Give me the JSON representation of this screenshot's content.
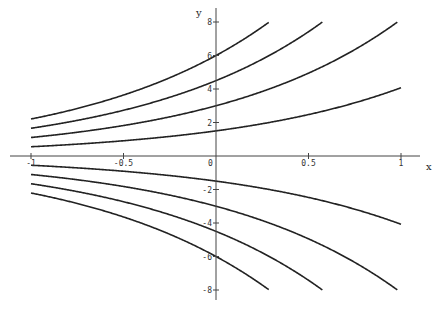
{
  "chart_data": {
    "type": "line",
    "title": "",
    "xlabel": "x",
    "ylabel": "y",
    "xlim": [
      -1,
      1
    ],
    "ylim": [
      -8.5,
      8.5
    ],
    "grid": false,
    "legend": "none",
    "x_ticks": [
      {
        "value": -1,
        "label": "-1"
      },
      {
        "value": -0.5,
        "label": "-0.5"
      },
      {
        "value": 0,
        "label": "0"
      },
      {
        "value": 0.5,
        "label": "0.5"
      },
      {
        "value": 1,
        "label": "1"
      }
    ],
    "y_ticks": [
      {
        "value": 8,
        "label": "8"
      },
      {
        "value": 6,
        "label": "6"
      },
      {
        "value": 4,
        "label": "4"
      },
      {
        "value": 2,
        "label": "2"
      },
      {
        "value": -2,
        "label": "-2"
      },
      {
        "value": -4,
        "label": "-4"
      },
      {
        "value": -6,
        "label": "-6"
      },
      {
        "value": -8,
        "label": "-8"
      }
    ],
    "series": [
      {
        "name": "C=6",
        "C": 6
      },
      {
        "name": "C=4.5",
        "C": 4.5
      },
      {
        "name": "C=3",
        "C": 3
      },
      {
        "name": "C=1.5",
        "C": 1.5
      },
      {
        "name": "C=-1.5",
        "C": -1.5
      },
      {
        "name": "C=-3",
        "C": -3
      },
      {
        "name": "C=-4.5",
        "C": -4.5
      },
      {
        "name": "C=-6",
        "C": -6
      }
    ],
    "colors": {
      "curve": "#222222",
      "axis": "#444444"
    }
  }
}
